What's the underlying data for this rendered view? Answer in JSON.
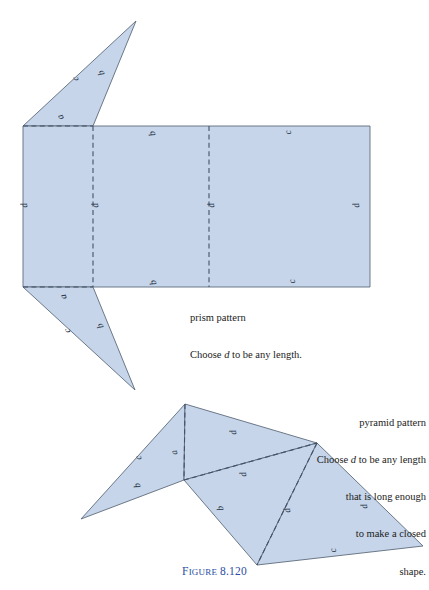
{
  "figure": {
    "number_prefix_cap": "F",
    "number_prefix_rest": "IGURE",
    "number_value": "8.120",
    "caption_color": "#2b4ea2"
  },
  "colors": {
    "shape_fill": "#c6d5ea",
    "shape_stroke": "#5d6b7c",
    "fold_line": "#41526b",
    "label_text": "#23303f"
  },
  "prism": {
    "caption_line1": "prism pattern",
    "caption_line2_pre": "Choose ",
    "caption_line2_var": "d",
    "caption_line2_post": " to be any length.",
    "labels": [
      {
        "text": "c",
        "x": 78,
        "y": 78,
        "rot": -108
      },
      {
        "text": "b",
        "x": 104,
        "y": 72,
        "rot": -110
      },
      {
        "text": "a",
        "x": 63,
        "y": 116,
        "rot": -114
      },
      {
        "text": "b",
        "x": 155,
        "y": 133,
        "rot": -104
      },
      {
        "text": "c",
        "x": 291,
        "y": 132,
        "rot": -100
      },
      {
        "text": "d",
        "x": 27,
        "y": 205,
        "rot": -100
      },
      {
        "text": "d",
        "x": 98,
        "y": 205,
        "rot": -100
      },
      {
        "text": "d",
        "x": 214,
        "y": 205,
        "rot": -100
      },
      {
        "text": "d",
        "x": 359,
        "y": 205,
        "rot": -100
      },
      {
        "text": "b",
        "x": 156,
        "y": 282,
        "rot": -104
      },
      {
        "text": "c",
        "x": 295,
        "y": 281,
        "rot": -100
      },
      {
        "text": "a",
        "x": 66,
        "y": 296,
        "rot": -106
      },
      {
        "text": "c",
        "x": 70,
        "y": 330,
        "rot": -106
      },
      {
        "text": "b",
        "x": 103,
        "y": 325,
        "rot": -110
      }
    ],
    "shapes": {
      "top_triangle": "23,126 136,21 93,126",
      "rectangle": "23,126 370,126 370,287 23,287",
      "bottom_triangle": "23,287 93,287 135,390",
      "fold_vertical_1": "93,126 93,287",
      "fold_vertical_2": "209,126 209,287",
      "fold_top_horizontal": "23,126 93,126",
      "fold_bottom_horizontal": "23,287 93,287"
    }
  },
  "pyramid": {
    "caption_line1": "pyramid pattern",
    "caption_line2_pre": "Choose ",
    "caption_line2_var": "d",
    "caption_line2_post": " to be any length",
    "caption_line3": "that is long enough",
    "caption_line4": "to make a closed",
    "caption_line5": "shape.",
    "labels": [
      {
        "text": "c",
        "x": 141,
        "y": 457,
        "rot": -108
      },
      {
        "text": "a",
        "x": 177,
        "y": 452,
        "rot": -102
      },
      {
        "text": "d",
        "x": 236,
        "y": 432,
        "rot": -100
      },
      {
        "text": "b",
        "x": 140,
        "y": 485,
        "rot": -102
      },
      {
        "text": "d",
        "x": 246,
        "y": 474,
        "rot": -100
      },
      {
        "text": "b",
        "x": 223,
        "y": 508,
        "rot": -100
      },
      {
        "text": "d",
        "x": 290,
        "y": 510,
        "rot": -100
      },
      {
        "text": "d",
        "x": 367,
        "y": 506,
        "rot": -100
      },
      {
        "text": "c",
        "x": 336,
        "y": 550,
        "rot": -100
      }
    ],
    "shapes": {
      "left_wing": "81,519 185,404 184,480",
      "upper_panel": "185,404 317,443 184,480",
      "lower_panel": "184,480 317,443 257,565",
      "right_panel": "317,443 423,546 257,565",
      "fold_apex_notch": "185,404 184,480",
      "fold_notch_right": "184,480 317,443",
      "fold_right_bottom": "317,443 257,565"
    }
  }
}
